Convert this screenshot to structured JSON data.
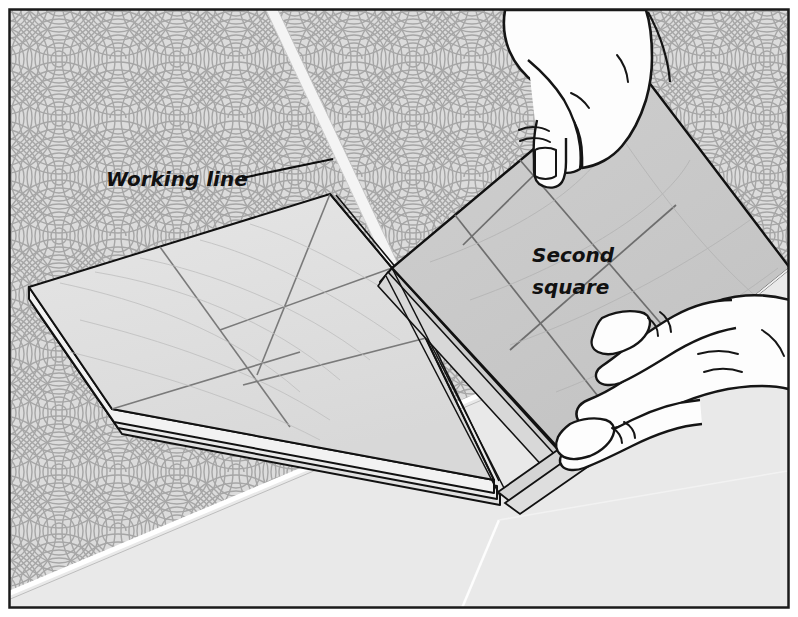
{
  "illustration": {
    "title": "Folding a paper panel to form the second square",
    "medium": "line-art diagram",
    "background_pattern": "seigaiha-concentric-arcs",
    "frame": {
      "border_color": "#1a1a1a",
      "margin_color": "#ffffff"
    }
  },
  "labels": {
    "working_line": {
      "text": "Working line",
      "font_size": 20,
      "x": 106,
      "y": 186,
      "leader_from_x": 242,
      "leader_from_y": 178,
      "leader_to_x": 333,
      "leader_to_y": 159
    },
    "second_square": {
      "line1": "Second",
      "line2": "square",
      "font_size": 20,
      "x": 532,
      "y": 262
    }
  },
  "colors": {
    "background": "#dcdcdc",
    "arc_stroke": "#a9a9a9",
    "flat_panel": "#e2e2e2",
    "raised_panel": "#c9c9c9",
    "panel_edge_dark": "#1a1a1a",
    "panel_line": "#6e6e6e",
    "hand_fill": "#fdfdfd",
    "hand_outline": "#151515",
    "foreground_band": "#e8e8e8",
    "highlight_white": "#ffffff",
    "working_line_strip": "#f2f2f2"
  },
  "scene": {
    "flat_panel_name": "left flat panel",
    "raised_panel_name": "lifted second square panel",
    "hands": [
      {
        "name": "upper-hand",
        "description": "thumb pressing the top corner of the lifted panel"
      },
      {
        "name": "lower-hand",
        "description": "fingers gripping the lower edge of the lifted panel"
      }
    ],
    "layer_count": 3
  },
  "geometry": {
    "working_strip": [
      [
        268,
        18
      ],
      [
        277,
        18
      ],
      [
        398,
        266
      ],
      [
        389,
        268
      ]
    ],
    "flat_panel_top": [
      [
        37,
        297
      ],
      [
        330,
        196
      ],
      [
        389,
        266
      ],
      [
        120,
        420
      ]
    ],
    "raised_panel": [
      [
        635,
        65
      ],
      [
        790,
        268
      ],
      [
        560,
        452
      ],
      [
        392,
        268
      ]
    ],
    "foreground_band_top": [
      [
        8,
        592
      ],
      [
        790,
        262
      ]
    ]
  }
}
